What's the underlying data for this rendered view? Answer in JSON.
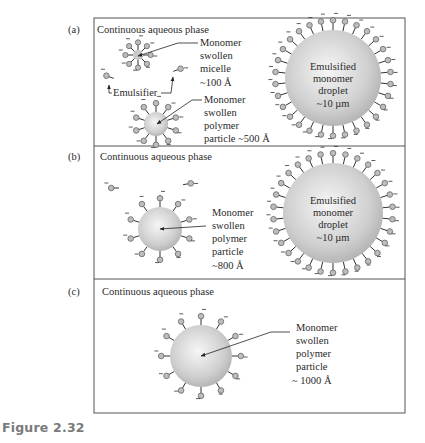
{
  "figure": {
    "caption": "Figure 2.32",
    "frame": {
      "left": 94,
      "right": 405,
      "top": 18,
      "bottom": 413,
      "dividers": [
        146,
        279
      ],
      "stroke": "#555555"
    },
    "colors": {
      "sphere_center": "#f4f4f4",
      "sphere_edge": "#b8b8b8",
      "head_fill": "#bdbdbd",
      "head_stroke": "#707070",
      "line": "#333333",
      "text": "#2a2a2a",
      "caption": "#7a7a7a"
    }
  },
  "panels": [
    {
      "id": "a",
      "label": "(a)",
      "phase_label": "Continuous aqueous phase",
      "micelle": {
        "cx": 138,
        "cy": 55,
        "r": 5,
        "count": 8,
        "label_lines": [
          "Monomer",
          "swollen",
          "micelle",
          "~100 Å"
        ]
      },
      "emulsifier_label": "Emulsifier",
      "free_emulsifiers": [
        {
          "x": 110,
          "y": 77,
          "angle": 200
        },
        {
          "x": 177,
          "y": 70,
          "angle": -20
        }
      ],
      "polymer_particle": {
        "cx": 156,
        "cy": 124,
        "r": 12,
        "count": 10,
        "label_lines": [
          "Monomer",
          "swollen",
          "polymer",
          "particle ~500 Å"
        ]
      },
      "droplet": {
        "cx": 333,
        "cy": 78,
        "r": 48,
        "count": 30,
        "label_lines": [
          "Emulsified",
          "monomer",
          "droplet",
          "~10 µm"
        ]
      }
    },
    {
      "id": "b",
      "label": "(b)",
      "phase_label": "Continuous aqueous phase",
      "free_emulsifiers": [
        {
          "x": 115,
          "y": 188,
          "angle": 180
        },
        {
          "x": 187,
          "y": 184,
          "angle": -10
        }
      ],
      "polymer_particle": {
        "cx": 160,
        "cy": 229,
        "r": 22,
        "count": 10,
        "label_lines": [
          "Monomer",
          "swollen",
          "polymer",
          "particle",
          "~800 Å"
        ]
      },
      "droplet": {
        "cx": 333,
        "cy": 213,
        "r": 50,
        "count": 30,
        "label_lines": [
          "Emulsified",
          "monomer",
          "droplet",
          "~10 µm"
        ]
      }
    },
    {
      "id": "c",
      "label": "(c)",
      "phase_label": "Continuous aqueous phase",
      "polymer_particle": {
        "cx": 201,
        "cy": 356,
        "r": 31,
        "count": 12,
        "label_lines": [
          "Monomer",
          "swollen",
          "polymer",
          "particle",
          "~ 1000 Å"
        ]
      }
    }
  ]
}
